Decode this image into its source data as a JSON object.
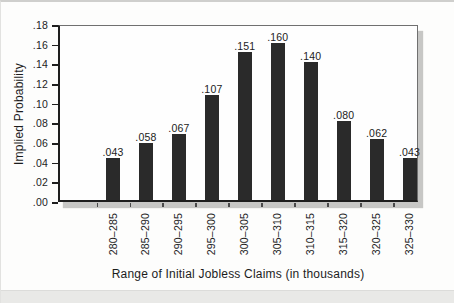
{
  "chart_data": {
    "type": "bar",
    "title": "",
    "xlabel": "Range of Initial Jobless Claims (in thousands)",
    "ylabel": "Implied Probability",
    "categories": [
      "280–285",
      "285–290",
      "290–295",
      "295–300",
      "300–305",
      "305–310",
      "310–315",
      "315–320",
      "320–325",
      "325–330"
    ],
    "values": [
      0.043,
      0.058,
      0.067,
      0.107,
      0.151,
      0.16,
      0.14,
      0.08,
      0.062,
      0.043
    ],
    "value_labels": [
      ".043",
      ".058",
      ".067",
      ".107",
      ".151",
      ".160",
      ".140",
      ".080",
      ".062",
      ".043"
    ],
    "ylim": [
      0,
      0.18
    ],
    "ytick_step": 0.02,
    "ytick_labels": [
      ".00",
      ".02",
      ".04",
      ".06",
      ".08",
      ".10",
      ".12",
      ".14",
      ".16",
      ".18"
    ],
    "grid": false,
    "legend_position": "none"
  },
  "colors": {
    "bar": "#2a2a2a",
    "axis": "#1e1e1e",
    "frame": "#707070",
    "shadow": "#c7c7c5",
    "text": "#1c1c1c",
    "page_bottom_strip": "#e9e9e7"
  }
}
